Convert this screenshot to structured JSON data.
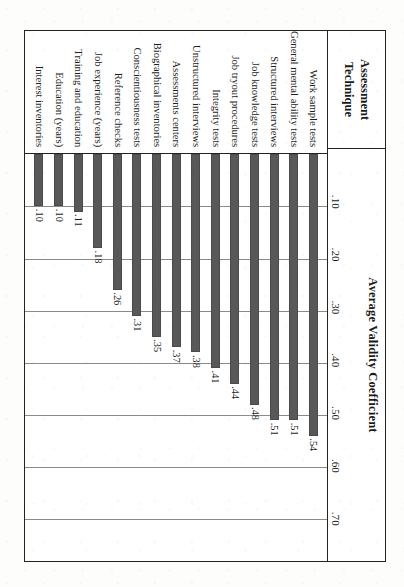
{
  "page": {
    "source_caption": "chological Bulletin, 124, 265."
  },
  "table": {
    "technique_header": "Assessment\nTechnique",
    "technique_header_line1": "Assessment",
    "technique_header_line2": "Technique",
    "value_header": "Average Validity Coefficient"
  },
  "chart_data": {
    "type": "bar",
    "orientation": "horizontal",
    "title": "Average Validity Coefficient",
    "xlabel": "Average Validity Coefficient",
    "ylabel": "Assessment Technique",
    "xlim": [
      0,
      0.78
    ],
    "grid": true,
    "grid_axis": "x",
    "legend": "none",
    "bar_color": "#585858",
    "tick_labels": [
      ".10",
      ".20",
      ".30",
      ".40",
      ".50",
      ".60",
      ".70"
    ],
    "ticks": [
      0.1,
      0.2,
      0.3,
      0.4,
      0.5,
      0.6,
      0.7
    ],
    "categories": [
      "Work sample tests",
      "General mental ability tests",
      "Structured interviews",
      "Job knowledge tests",
      "Job tryout procedures",
      "Integrity tests",
      "Unstructured interviews",
      "Assessments centers",
      "Biographical inventories",
      "Conscientiousness tests",
      "Reference checks",
      "Job experience (years)",
      "Training and education",
      "Education (years)",
      "Interest inventories"
    ],
    "values": [
      0.54,
      0.51,
      0.51,
      0.48,
      0.44,
      0.41,
      0.38,
      0.37,
      0.35,
      0.31,
      0.26,
      0.18,
      0.11,
      0.1,
      0.1
    ],
    "value_labels": [
      ".54",
      ".51",
      ".51",
      ".48",
      ".44",
      ".41",
      ".38",
      ".37",
      ".35",
      ".31",
      ".26",
      ".18",
      ".11",
      ".10",
      ".10"
    ]
  }
}
